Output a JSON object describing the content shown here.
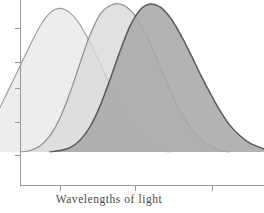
{
  "figure": {
    "background_color": "#ffffff",
    "axis_color": "#9a9a9a"
  },
  "axes": {
    "x_title": "Wavelengths of light",
    "y_title": "",
    "x_tick_count": 3,
    "y_tick_count": 5,
    "x_ticks": [
      60,
      135,
      212
    ],
    "y_ticks": [
      28,
      62,
      88,
      122,
      155
    ],
    "x_tick_labels": [
      "",
      "",
      ""
    ],
    "y_tick_labels": [
      "",
      "",
      "",
      "",
      ""
    ],
    "grid": false,
    "origin_x": 20,
    "baseline_y": 185
  },
  "chart_data": {
    "type": "area",
    "title": "",
    "subtitle": "",
    "xlabel": "Wavelengths of light",
    "ylabel": "",
    "xlim": [
      0,
      264
    ],
    "ylim": [
      0,
      1
    ],
    "grid": false,
    "legend": "none",
    "annotations": [],
    "x": [
      0,
      10,
      20,
      30,
      40,
      50,
      60,
      70,
      80,
      90,
      100,
      110,
      120,
      130,
      140,
      150,
      160,
      170,
      180,
      190,
      200,
      210,
      220,
      230,
      240,
      250,
      264
    ],
    "series": [
      {
        "name": "short-wavelength-curve",
        "peak_x": 57,
        "peak_y": 0.97,
        "fill_color": "#e9e9e9",
        "stroke_color": "#9d9d9d",
        "values": [
          0.3,
          0.44,
          0.58,
          0.72,
          0.85,
          0.94,
          0.97,
          0.94,
          0.86,
          0.74,
          0.6,
          0.45,
          0.31,
          0.19,
          0.1,
          0.04,
          0.01,
          0.0,
          0.0,
          0.0,
          0.0,
          0.0,
          0.0,
          0.0,
          0.0,
          0.0,
          0.0
        ]
      },
      {
        "name": "medium-wavelength-curve",
        "peak_x": 122,
        "peak_y": 1.0,
        "fill_color": "#dadada",
        "stroke_color": "#8f8f8f",
        "values": [
          0.0,
          0.0,
          0.0,
          0.01,
          0.04,
          0.11,
          0.23,
          0.4,
          0.6,
          0.79,
          0.93,
          0.99,
          1.0,
          0.96,
          0.87,
          0.74,
          0.58,
          0.42,
          0.28,
          0.17,
          0.09,
          0.04,
          0.01,
          0.0,
          0.0,
          0.0,
          0.0
        ]
      },
      {
        "name": "long-wavelength-curve",
        "peak_x": 155,
        "peak_y": 1.0,
        "fill_color": "#a9a9a9",
        "stroke_color": "#5a5a5a",
        "values": [
          0.0,
          0.0,
          0.0,
          0.0,
          0.0,
          0.0,
          0.01,
          0.03,
          0.08,
          0.17,
          0.31,
          0.49,
          0.68,
          0.85,
          0.96,
          1.0,
          0.98,
          0.91,
          0.8,
          0.67,
          0.53,
          0.4,
          0.28,
          0.18,
          0.11,
          0.06,
          0.02
        ]
      }
    ]
  }
}
